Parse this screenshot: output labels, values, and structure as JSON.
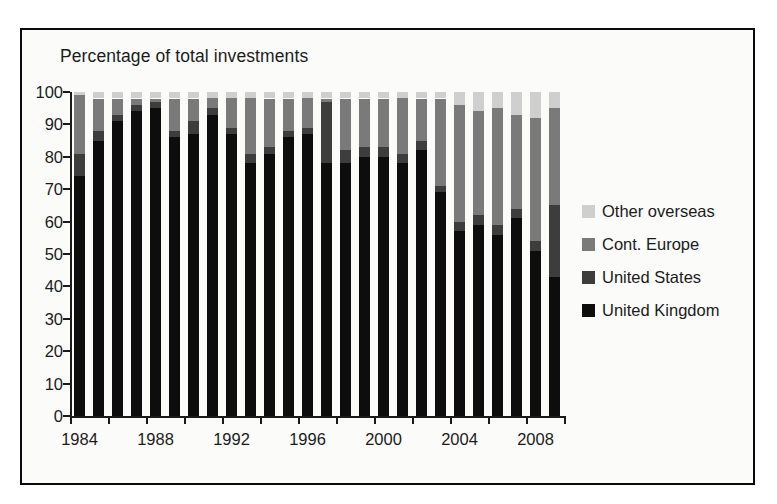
{
  "chart_data": {
    "type": "bar",
    "stacked": true,
    "title": "Percentage of total investments",
    "xlabel": "",
    "ylabel": "",
    "ylim": [
      0,
      100
    ],
    "ytick_step": 10,
    "ytick_labels": [
      "100",
      "90",
      "80",
      "70",
      "60",
      "50",
      "40",
      "30",
      "20",
      "10",
      "0"
    ],
    "ytick_values": [
      100,
      90,
      80,
      70,
      60,
      50,
      40,
      30,
      20,
      10,
      0
    ],
    "grid": false,
    "legend_position": "right",
    "categories": [
      "1984",
      "1985",
      "1986",
      "1987",
      "1988",
      "1989",
      "1990",
      "1991",
      "1992",
      "1993",
      "1994",
      "1995",
      "1996",
      "1997",
      "1998",
      "1999",
      "2000",
      "2001",
      "2002",
      "2003",
      "2004",
      "2005",
      "2006",
      "2007",
      "2008",
      "2009"
    ],
    "xtick_labels": [
      "1984",
      "1988",
      "1992",
      "1996",
      "2000",
      "2004",
      "2008"
    ],
    "xtick_categories": [
      "1984",
      "1988",
      "1992",
      "1996",
      "2000",
      "2004",
      "2008"
    ],
    "series": [
      {
        "name": "United Kingdom",
        "color": "#0d0d0d",
        "values": [
          74,
          85,
          91,
          94,
          95,
          86,
          87,
          93,
          87,
          78,
          81,
          86,
          87,
          78,
          78,
          80,
          80,
          78,
          82,
          69,
          57,
          59,
          56,
          61,
          51,
          43
        ]
      },
      {
        "name": "United States",
        "color": "#3d3d3d",
        "values": [
          7,
          3,
          2,
          2,
          2,
          2,
          4,
          2,
          2,
          3,
          2,
          2,
          2,
          19,
          4,
          3,
          3,
          3,
          3,
          2,
          3,
          3,
          3,
          3,
          3,
          22
        ]
      },
      {
        "name": "Cont. Europe",
        "color": "#7a7a7a",
        "values": [
          18,
          10,
          5,
          2,
          1,
          10,
          7,
          3,
          9,
          17,
          15,
          10,
          9,
          1,
          16,
          15,
          15,
          17,
          13,
          27,
          36,
          32,
          36,
          29,
          38,
          30
        ]
      },
      {
        "name": "Other overseas",
        "color": "#cfcfcf",
        "values": [
          1,
          2,
          2,
          2,
          2,
          2,
          2,
          2,
          2,
          2,
          2,
          2,
          2,
          2,
          2,
          2,
          2,
          2,
          2,
          2,
          4,
          6,
          5,
          7,
          8,
          5
        ]
      }
    ]
  },
  "legend": {
    "items": [
      {
        "label": "Other overseas",
        "color": "#cfcfcf"
      },
      {
        "label": "Cont. Europe",
        "color": "#7a7a7a"
      },
      {
        "label": "United States",
        "color": "#3d3d3d"
      },
      {
        "label": "United Kingdom",
        "color": "#0d0d0d"
      }
    ]
  }
}
